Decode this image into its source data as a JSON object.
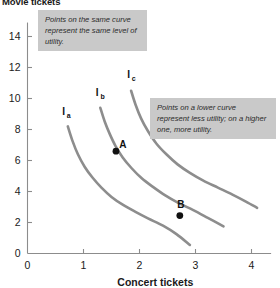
{
  "chart_data": {
    "type": "line",
    "title": "Movie tickets",
    "xlabel": "Concert tickets",
    "ylabel": "Movie tickets",
    "xlim": [
      0,
      4.35
    ],
    "ylim": [
      0,
      14.9
    ],
    "xticks": [
      "0",
      "1",
      "2",
      "3",
      "4"
    ],
    "xtick_values": [
      0,
      1,
      2,
      3,
      4
    ],
    "yticks": [
      "0",
      "2",
      "4",
      "6",
      "8",
      "10",
      "12",
      "14"
    ],
    "ytick_values": [
      0,
      2,
      4,
      6,
      8,
      10,
      12,
      14
    ],
    "grid": false,
    "legend": "none",
    "curve_color": "#8d8d8d",
    "series": [
      {
        "name": "Ia",
        "label": "I",
        "label_sub": "a",
        "label_x": 0.62,
        "label_y": 8.95,
        "points": [
          [
            0.72,
            8.2
          ],
          [
            0.8,
            7.3
          ],
          [
            0.9,
            6.4
          ],
          [
            1.02,
            5.6
          ],
          [
            1.16,
            4.9
          ],
          [
            1.32,
            4.25
          ],
          [
            1.5,
            3.65
          ],
          [
            1.7,
            3.15
          ],
          [
            1.92,
            2.7
          ],
          [
            2.16,
            2.25
          ],
          [
            2.42,
            1.8
          ],
          [
            2.66,
            1.25
          ],
          [
            2.9,
            0.55
          ]
        ]
      },
      {
        "name": "Ib",
        "label": "I",
        "label_sub": "b",
        "label_x": 1.22,
        "label_y": 10.15,
        "points": [
          [
            1.3,
            9.4
          ],
          [
            1.38,
            8.5
          ],
          [
            1.47,
            7.7
          ],
          [
            1.57,
            6.95
          ],
          [
            1.7,
            6.2
          ],
          [
            1.86,
            5.5
          ],
          [
            2.04,
            4.85
          ],
          [
            2.24,
            4.3
          ],
          [
            2.46,
            3.75
          ],
          [
            2.7,
            3.25
          ],
          [
            2.96,
            2.8
          ],
          [
            3.22,
            2.3
          ],
          [
            3.5,
            1.75
          ]
        ]
      },
      {
        "name": "Ic",
        "label": "I",
        "label_sub": "c",
        "label_x": 1.78,
        "label_y": 11.3,
        "points": [
          [
            1.85,
            10.5
          ],
          [
            1.93,
            9.6
          ],
          [
            2.03,
            8.7
          ],
          [
            2.15,
            7.9
          ],
          [
            2.3,
            7.1
          ],
          [
            2.48,
            6.4
          ],
          [
            2.68,
            5.75
          ],
          [
            2.9,
            5.2
          ],
          [
            3.14,
            4.7
          ],
          [
            3.4,
            4.25
          ],
          [
            3.66,
            3.8
          ],
          [
            3.9,
            3.35
          ],
          [
            4.1,
            2.95
          ]
        ]
      }
    ],
    "points": [
      {
        "label": "A",
        "x": 1.58,
        "y": 6.6,
        "label_dx": 7,
        "label_dy": -3
      },
      {
        "label": "B",
        "x": 2.72,
        "y": 2.45,
        "label_dx": 1,
        "label_dy": -8
      }
    ],
    "annotations": [
      {
        "id": "annot-1",
        "text": "Points on the same curve represent the same level of utility."
      },
      {
        "id": "annot-2",
        "text": "Points on a lower curve represent less utility; on a higher one, more utility."
      }
    ]
  }
}
